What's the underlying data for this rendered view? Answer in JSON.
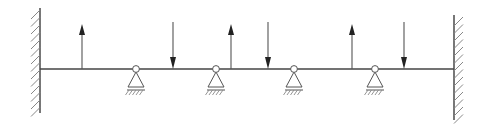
{
  "diagram": {
    "colors": {
      "line": "#555555",
      "beam": "#444444",
      "hatch": "#888888",
      "arrow": "#222222",
      "support_fill": "#ffffff"
    },
    "beam": {
      "x1": 40,
      "x2": 454,
      "y": 69
    },
    "walls": [
      {
        "side": "left",
        "x": 40,
        "y1": 8,
        "y2": 113
      },
      {
        "side": "right",
        "x": 454,
        "y1": 15,
        "y2": 120
      }
    ],
    "supports": [
      {
        "type": "pin",
        "x": 136
      },
      {
        "type": "pin",
        "x": 216
      },
      {
        "type": "pin",
        "x": 294
      },
      {
        "type": "pin",
        "x": 375
      }
    ],
    "loads": [
      {
        "direction": "up",
        "x": 82
      },
      {
        "direction": "down",
        "x": 173
      },
      {
        "direction": "up",
        "x": 231
      },
      {
        "direction": "down",
        "x": 268
      },
      {
        "direction": "up",
        "x": 352
      },
      {
        "direction": "down",
        "x": 404
      }
    ]
  }
}
